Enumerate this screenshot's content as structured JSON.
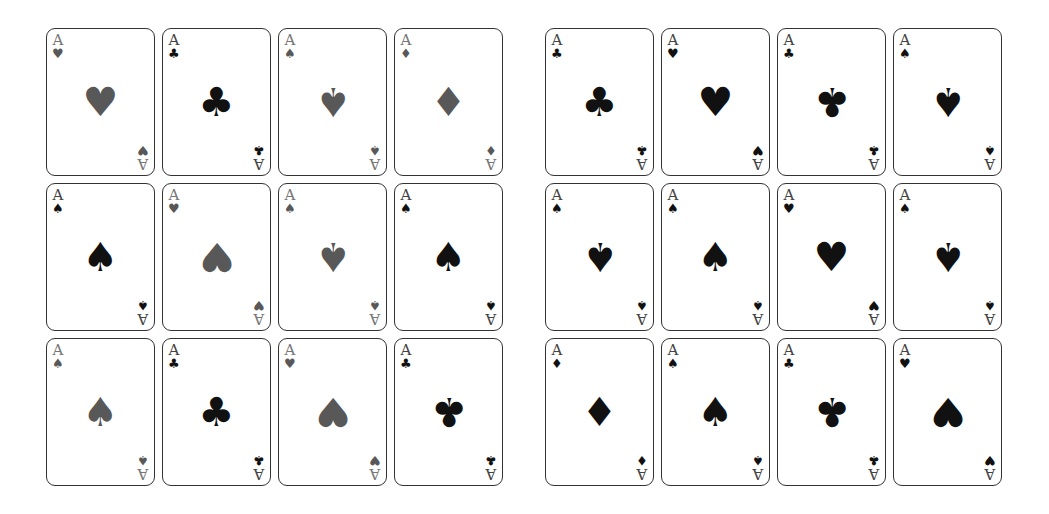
{
  "suit_glyphs": {
    "heart": "♥",
    "club": "♣",
    "spade": "♠",
    "diamond": "♦"
  },
  "colors": {
    "gray": "#585858",
    "black": "#111111"
  },
  "groups": [
    {
      "name": "left",
      "cards": [
        {
          "rank": "A",
          "suit": "heart",
          "glyph": "♥",
          "color": "gray",
          "inverted": false
        },
        {
          "rank": "A",
          "suit": "club",
          "glyph": "♣",
          "color": "black",
          "inverted": false
        },
        {
          "rank": "A",
          "suit": "spade",
          "glyph": "♠",
          "color": "gray",
          "inverted": true
        },
        {
          "rank": "A",
          "suit": "diamond",
          "glyph": "♦",
          "color": "gray",
          "inverted": false
        },
        {
          "rank": "A",
          "suit": "spade",
          "glyph": "♠",
          "color": "black",
          "inverted": false
        },
        {
          "rank": "A",
          "suit": "heart",
          "glyph": "♥",
          "color": "gray",
          "inverted": true
        },
        {
          "rank": "A",
          "suit": "spade",
          "glyph": "♠",
          "color": "gray",
          "inverted": true
        },
        {
          "rank": "A",
          "suit": "spade",
          "glyph": "♠",
          "color": "black",
          "inverted": false
        },
        {
          "rank": "A",
          "suit": "spade",
          "glyph": "♠",
          "color": "gray",
          "inverted": false
        },
        {
          "rank": "A",
          "suit": "club",
          "glyph": "♣",
          "color": "black",
          "inverted": false
        },
        {
          "rank": "A",
          "suit": "heart",
          "glyph": "♥",
          "color": "gray",
          "inverted": true
        },
        {
          "rank": "A",
          "suit": "club",
          "glyph": "♣",
          "color": "black",
          "inverted": true
        }
      ]
    },
    {
      "name": "right",
      "cards": [
        {
          "rank": "A",
          "suit": "club",
          "glyph": "♣",
          "color": "black",
          "inverted": false
        },
        {
          "rank": "A",
          "suit": "heart",
          "glyph": "♥",
          "color": "black",
          "inverted": false
        },
        {
          "rank": "A",
          "suit": "club",
          "glyph": "♣",
          "color": "black",
          "inverted": true
        },
        {
          "rank": "A",
          "suit": "spade",
          "glyph": "♠",
          "color": "black",
          "inverted": true
        },
        {
          "rank": "A",
          "suit": "spade",
          "glyph": "♠",
          "color": "black",
          "inverted": true
        },
        {
          "rank": "A",
          "suit": "spade",
          "glyph": "♠",
          "color": "black",
          "inverted": false
        },
        {
          "rank": "A",
          "suit": "heart",
          "glyph": "♥",
          "color": "black",
          "inverted": false
        },
        {
          "rank": "A",
          "suit": "spade",
          "glyph": "♠",
          "color": "black",
          "inverted": true
        },
        {
          "rank": "A",
          "suit": "diamond",
          "glyph": "♦",
          "color": "black",
          "inverted": false
        },
        {
          "rank": "A",
          "suit": "spade",
          "glyph": "♠",
          "color": "black",
          "inverted": false
        },
        {
          "rank": "A",
          "suit": "club",
          "glyph": "♣",
          "color": "black",
          "inverted": true
        },
        {
          "rank": "A",
          "suit": "heart",
          "glyph": "♥",
          "color": "black",
          "inverted": true
        }
      ]
    }
  ]
}
